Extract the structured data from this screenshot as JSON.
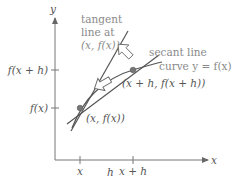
{
  "diagram": {
    "axes": {
      "x_label": "x",
      "y_label": "y"
    },
    "y_ticks": [
      {
        "label": "f(x + h)"
      },
      {
        "label": "f(x)"
      }
    ],
    "x_ticks": [
      {
        "label": "x"
      },
      {
        "label": "x + h"
      }
    ],
    "interval": {
      "label": "h"
    },
    "points": [
      {
        "label": "(x, f(x))"
      },
      {
        "label": "(x + h, f(x + h))"
      }
    ],
    "annotations": {
      "tangent_line_1": "tangent",
      "tangent_line_2": "line at",
      "tangent_line_3": "(x, f(x))",
      "secant_line": "secant line",
      "curve": "curve y = f(x)"
    },
    "colors": {
      "line": "#555555",
      "axis": "#777777",
      "label": "#555555",
      "label_gray": "#8a8a8a",
      "point": "#777777"
    }
  }
}
